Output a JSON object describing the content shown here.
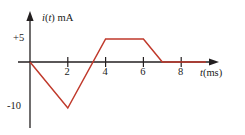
{
  "figure": {
    "background_color": "#ffffff",
    "axis_color": "#231f20",
    "curve_color": "#c0392b"
  },
  "axes": {
    "y_axis_label": "i(t) mA",
    "y_axis_label_var": "i",
    "y_axis_label_paren_var": "t",
    "y_axis_label_unit": " mA",
    "x_axis_label": "t(ms)",
    "x_axis_label_var": "t",
    "x_axis_label_unit": "(ms)",
    "x_ticks": [
      "2",
      "4",
      "6",
      "8"
    ],
    "y_ticks": [
      "+5",
      "-10"
    ]
  },
  "chart_data": {
    "type": "line",
    "title": "",
    "xlabel": "t(ms)",
    "ylabel": "i(t) mA",
    "xlim": [
      0,
      9.3
    ],
    "ylim": [
      -13,
      7
    ],
    "grid": false,
    "legend": null,
    "x_tick_values": [
      2,
      4,
      6,
      8
    ],
    "x_tick_labels": [
      "2",
      "4",
      "6",
      "8"
    ],
    "y_tick_values": [
      5,
      -10
    ],
    "y_tick_labels": [
      "+5",
      "-10"
    ],
    "series": [
      {
        "name": "i(t)",
        "color": "#c0392b",
        "x": [
          0,
          2,
          4,
          6,
          7,
          9.3
        ],
        "y": [
          0,
          -10,
          5,
          5,
          0,
          0
        ],
        "points": [
          {
            "t": 0,
            "i": 0
          },
          {
            "t": 2,
            "i": -10
          },
          {
            "t": 4,
            "i": 5
          },
          {
            "t": 6,
            "i": 5
          },
          {
            "t": 7,
            "i": 0
          }
        ]
      }
    ]
  }
}
